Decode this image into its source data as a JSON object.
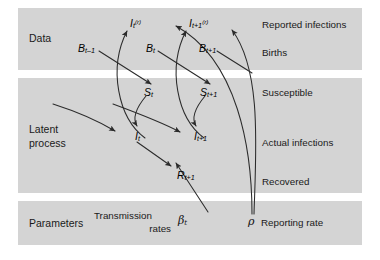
{
  "figure": {
    "type": "state-space-model-diagram",
    "title": "",
    "background": "#ffffff",
    "band_color": "#d4d4d4",
    "line_color": "#2b2b2b"
  },
  "bands": [
    {
      "id": "data",
      "category_label": "Data"
    },
    {
      "id": "latent",
      "category_label_line1": "Latent",
      "category_label_line2": "process"
    },
    {
      "id": "parameters",
      "category_label": "Parameters"
    }
  ],
  "row_labels": [
    {
      "id": "reported-infections",
      "text": "Reported infections"
    },
    {
      "id": "births",
      "text": "Births"
    },
    {
      "id": "susceptible",
      "text": "Susceptible"
    },
    {
      "id": "actual-infections",
      "text": "Actual infections"
    },
    {
      "id": "recovered",
      "text": "Recovered"
    },
    {
      "id": "reporting-rate",
      "text": "Reporting rate"
    }
  ],
  "nodes": [
    {
      "id": "I-t-reported",
      "base": "I",
      "sub": "t",
      "sup": "(r)"
    },
    {
      "id": "I-t1-reported",
      "base": "I",
      "sub": "t+1",
      "sup": "(r)"
    },
    {
      "id": "B-t-1",
      "base": "B",
      "sub": "t–1",
      "sup": ""
    },
    {
      "id": "B-t",
      "base": "B",
      "sub": "t",
      "sup": ""
    },
    {
      "id": "B-t1",
      "base": "B",
      "sub": "t+1",
      "sup": ""
    },
    {
      "id": "S-t",
      "base": "S",
      "sub": "t",
      "sup": ""
    },
    {
      "id": "S-t1",
      "base": "S",
      "sub": "t+1",
      "sup": ""
    },
    {
      "id": "I-t",
      "base": "I",
      "sub": "t",
      "sup": ""
    },
    {
      "id": "I-t1",
      "base": "I",
      "sub": "t+1",
      "sup": ""
    },
    {
      "id": "R-t1",
      "base": "R",
      "sub": "t+1",
      "sup": ""
    }
  ],
  "parameters": [
    {
      "id": "transmission-rates",
      "text_line1": "Transmission",
      "text_line2": "rates",
      "symbol": "β",
      "symbol_sub": "t"
    },
    {
      "id": "reporting-rate",
      "symbol": "ρ",
      "text": "Reporting rate"
    }
  ]
}
